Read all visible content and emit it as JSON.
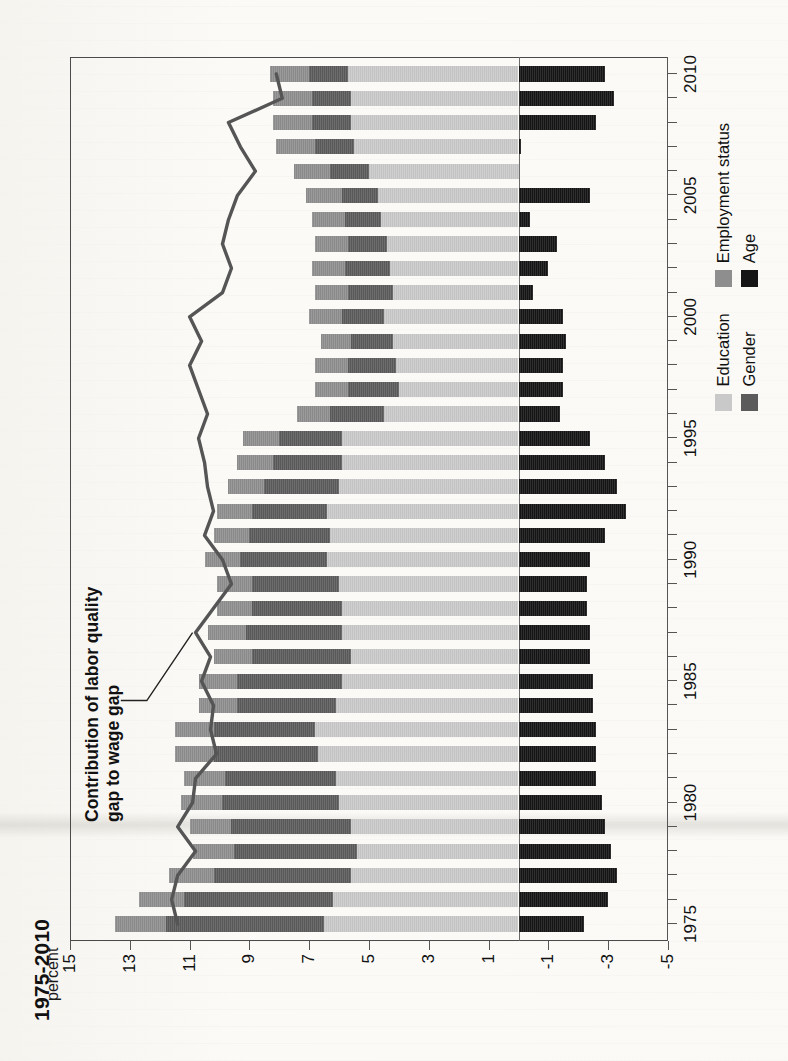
{
  "page": {
    "title_partial": "1975-2010",
    "annotation": "Contribution of labor quality\ngap to wage gap",
    "axis_unit_label": "percent"
  },
  "legend": {
    "items": [
      {
        "label": "Education",
        "color": "#c9c9c9"
      },
      {
        "label": "Gender",
        "color": "#5b5b5b"
      },
      {
        "label": "Employment status",
        "color": "#8e8e8e"
      },
      {
        "label": "Age",
        "color": "#151515"
      }
    ]
  },
  "chart_data": {
    "type": "bar",
    "title": "1975-2010",
    "subtitle": "",
    "xlabel": "",
    "ylabel": "percent",
    "ylim": [
      -5,
      15
    ],
    "xlim": [
      1974.3,
      2010.7
    ],
    "grid": false,
    "stacked": true,
    "orientation": "vertical",
    "legend_position": "bottom-right",
    "yticks": [
      15,
      13,
      11,
      9,
      7,
      5,
      3,
      1,
      -1,
      -3,
      -5
    ],
    "xticks": [
      1975,
      1980,
      1985,
      1990,
      1995,
      2000,
      2005,
      2010
    ],
    "categories": [
      1975,
      1976,
      1977,
      1978,
      1979,
      1980,
      1981,
      1982,
      1983,
      1984,
      1985,
      1986,
      1987,
      1988,
      1989,
      1990,
      1991,
      1992,
      1993,
      1994,
      1995,
      1996,
      1997,
      1998,
      1999,
      2000,
      2001,
      2002,
      2003,
      2004,
      2005,
      2006,
      2007,
      2008,
      2009,
      2010
    ],
    "series": [
      {
        "name": "Education",
        "color": "#c9c9c9",
        "values": [
          6.5,
          6.2,
          5.6,
          5.4,
          5.6,
          6.0,
          6.1,
          6.7,
          6.8,
          6.1,
          5.9,
          5.6,
          5.9,
          5.9,
          6.0,
          6.4,
          6.3,
          6.4,
          6.0,
          5.9,
          5.9,
          4.5,
          4.0,
          4.1,
          4.2,
          4.5,
          4.2,
          4.3,
          4.4,
          4.6,
          4.7,
          5.0,
          5.5,
          5.6,
          5.6,
          5.7
        ]
      },
      {
        "name": "Gender",
        "color": "#5b5b5b",
        "values": [
          5.3,
          5.0,
          4.6,
          4.1,
          4.0,
          3.9,
          3.7,
          3.5,
          3.4,
          3.3,
          3.5,
          3.3,
          3.2,
          3.0,
          2.9,
          2.9,
          2.7,
          2.5,
          2.5,
          2.3,
          2.1,
          1.8,
          1.7,
          1.6,
          1.4,
          1.4,
          1.5,
          1.5,
          1.3,
          1.2,
          1.2,
          1.3,
          1.3,
          1.3,
          1.3,
          1.3
        ]
      },
      {
        "name": "Employment status",
        "color": "#8e8e8e",
        "values": [
          1.7,
          1.5,
          1.5,
          1.4,
          1.4,
          1.4,
          1.4,
          1.3,
          1.3,
          1.3,
          1.3,
          1.3,
          1.3,
          1.2,
          1.2,
          1.2,
          1.2,
          1.2,
          1.2,
          1.2,
          1.2,
          1.1,
          1.1,
          1.1,
          1.0,
          1.1,
          1.1,
          1.1,
          1.1,
          1.1,
          1.2,
          1.2,
          1.3,
          1.3,
          1.3,
          1.3
        ]
      },
      {
        "name": "Age",
        "color": "#151515",
        "values": [
          -2.2,
          -3.0,
          -3.3,
          -3.1,
          -2.9,
          -2.8,
          -2.6,
          -2.6,
          -2.6,
          -2.5,
          -2.5,
          -2.4,
          -2.4,
          -2.3,
          -2.3,
          -2.4,
          -2.9,
          -3.6,
          -3.3,
          -2.9,
          -2.4,
          -1.4,
          -1.5,
          -1.5,
          -1.6,
          -1.5,
          -0.5,
          -1.0,
          -1.3,
          -0.4,
          -2.4,
          0.0,
          -0.1,
          -2.6,
          -3.2,
          -2.9
        ]
      }
    ],
    "line_series": {
      "name": "Contribution of labor quality gap to wage gap",
      "color": "#555555",
      "x": [
        1975,
        1976,
        1977,
        1978,
        1979,
        1980,
        1981,
        1982,
        1983,
        1984,
        1985,
        1986,
        1987,
        1988,
        1989,
        1990,
        1991,
        1992,
        1993,
        1994,
        1995,
        1996,
        1997,
        1998,
        1999,
        2000,
        2001,
        2002,
        2003,
        2004,
        2005,
        2006,
        2007,
        2008,
        2009,
        2010
      ],
      "values": [
        11.4,
        11.6,
        11.4,
        10.8,
        11.4,
        10.9,
        10.8,
        10.1,
        10.3,
        10.2,
        10.6,
        10.3,
        10.8,
        10.2,
        9.6,
        9.9,
        10.5,
        10.2,
        10.4,
        10.5,
        10.7,
        10.4,
        10.7,
        11.0,
        10.6,
        11.0,
        9.9,
        9.6,
        9.9,
        9.7,
        9.4,
        8.8,
        9.3,
        9.7,
        7.9,
        8.1,
        7.4
      ]
    }
  }
}
